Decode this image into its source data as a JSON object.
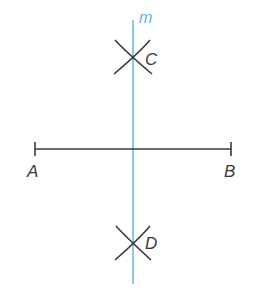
{
  "diagram": {
    "colors": {
      "bisector": "#6cbde0",
      "ink": "#3a3a3a",
      "background": "#ffffff"
    },
    "labels": {
      "line": "m",
      "point_c": "C",
      "point_d": "D",
      "point_a": "A",
      "point_b": "B"
    },
    "points": {
      "A": [
        35,
        149
      ],
      "B": [
        231,
        149
      ],
      "C": [
        133,
        57
      ],
      "D": [
        133,
        243
      ]
    },
    "bisector": {
      "x": 133,
      "y_start": 20,
      "y_end": 284
    }
  }
}
